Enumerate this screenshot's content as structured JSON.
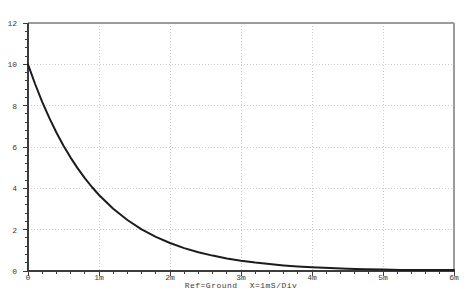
{
  "caption": {
    "ref": "Ref=Ground",
    "scale": "X=1mS/Div"
  },
  "colors": {
    "background": "#ffffff",
    "trace": "#1c1c1c",
    "grid": "#cbcbcb",
    "axis": "#3c3c3c",
    "frame": "#9b9b9b",
    "text": "#3a3a3a"
  },
  "chart_data": {
    "type": "line",
    "title": "",
    "xlabel": "X=1mS/Div",
    "ylabel": "",
    "x_unit": "ms",
    "xlim_ms": [
      0,
      6
    ],
    "ylim": [
      0,
      12
    ],
    "grid": true,
    "legend": "none",
    "x_ticks": [
      {
        "value_ms": 0,
        "label": "0"
      },
      {
        "value_ms": 1,
        "label": "1m"
      },
      {
        "value_ms": 2,
        "label": "2m"
      },
      {
        "value_ms": 3,
        "label": "3m"
      },
      {
        "value_ms": 4,
        "label": "4m"
      },
      {
        "value_ms": 5,
        "label": "5m"
      },
      {
        "value_ms": 6,
        "label": "6m"
      }
    ],
    "y_ticks": [
      {
        "value": 0,
        "label": "0"
      },
      {
        "value": 2,
        "label": "2"
      },
      {
        "value": 4,
        "label": "4"
      },
      {
        "value": 6,
        "label": "6"
      },
      {
        "value": 8,
        "label": "8"
      },
      {
        "value": 10,
        "label": "10"
      },
      {
        "value": 12,
        "label": "12"
      }
    ],
    "x_minor_step_ms": 0.2,
    "y_minor_step": 0.4,
    "series": [
      {
        "name": "exponential-decay-trace V(t)=10*exp(-t/1ms)",
        "x_ms": [
          0,
          0.1,
          0.2,
          0.3,
          0.4,
          0.5,
          0.6,
          0.7,
          0.8,
          0.9,
          1.0,
          1.2,
          1.4,
          1.6,
          1.8,
          2.0,
          2.2,
          2.4,
          2.6,
          2.8,
          3.0,
          3.2,
          3.4,
          3.6,
          3.8,
          4.0,
          4.25,
          4.5,
          4.75,
          5.0,
          5.25,
          5.5,
          5.75,
          6.0
        ],
        "y": [
          10,
          9.048,
          8.187,
          7.408,
          6.703,
          6.065,
          5.488,
          4.966,
          4.493,
          4.066,
          3.679,
          3.012,
          2.466,
          2.019,
          1.653,
          1.353,
          1.108,
          0.907,
          0.743,
          0.608,
          0.498,
          0.408,
          0.334,
          0.273,
          0.224,
          0.183,
          0.143,
          0.111,
          0.087,
          0.067,
          0.052,
          0.041,
          0.032,
          0.025
        ]
      }
    ]
  }
}
